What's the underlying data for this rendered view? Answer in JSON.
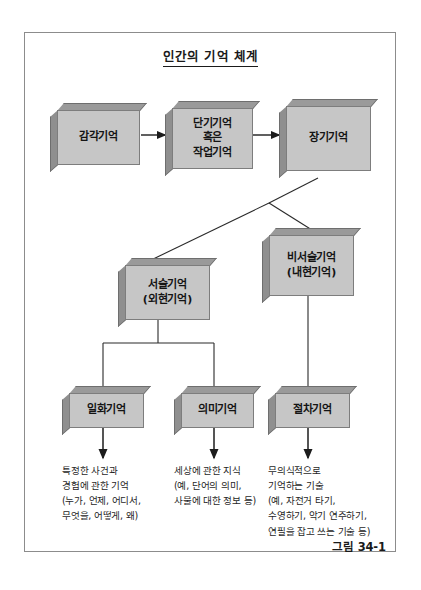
{
  "figure": {
    "title": "인간의 기억 체계",
    "caption": "그림 34-1",
    "frame_color": "#8c8c8c",
    "box_face_color": "#c6c6c6",
    "box_edge_color": "#8f8f8f",
    "line_color": "#222222"
  },
  "boxes": {
    "sensory_memory": {
      "label": "감각기억"
    },
    "short_term_memory": {
      "label": "단기기억\n혹은\n작업기억",
      "line1": "단기기억",
      "line2": "혹은",
      "line3": "작업기억"
    },
    "long_term_memory": {
      "label": "장기기억"
    },
    "declarative_memory": {
      "line1": "서술기억",
      "line2": "(외현기억)"
    },
    "nondeclarative_memory": {
      "line1": "비서술기억",
      "line2": "(내현기억)"
    },
    "episodic_memory": {
      "label": "일화기억"
    },
    "semantic_memory": {
      "label": "의미기억"
    },
    "procedural_memory": {
      "label": "절차기억"
    }
  },
  "descriptions": {
    "episodic": {
      "line1": "특정한 사건과",
      "line2": "경험에 관한 기억",
      "line3": "(누가, 언제, 어디서,",
      "line4": "무엇을, 어떻게, 왜)"
    },
    "semantic": {
      "line1": "세상에 관한 지식",
      "line2": "(예, 단어의 의미,",
      "line3": "사물에 대한 정보 등)"
    },
    "procedural": {
      "line1": "무의식적으로",
      "line2": "기억하는 기술",
      "line3": "(예, 자전거 타기,",
      "line4": "수영하기, 악기 연주하기,",
      "line5": "연필을 잡고 쓰는 기술 등)"
    }
  }
}
